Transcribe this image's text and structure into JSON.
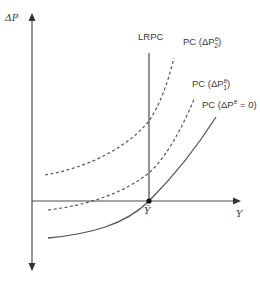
{
  "diagram": {
    "axes": {
      "y_label": "ΔP",
      "x_label": "Y",
      "origin_marker": "Ȳ"
    },
    "lines": {
      "lrpc_label": "LRPC",
      "pc2_label_prefix": "PC (ΔP",
      "pc2_sup": "e",
      "pc2_sub": "2",
      "pc2_label_suffix": ")",
      "pc1_label_prefix": "PC (ΔP",
      "pc1_sup": "e",
      "pc1_sub": "1",
      "pc1_label_suffix": ")",
      "pc0_label_prefix": "PC (ΔP",
      "pc0_sup": "e",
      "pc0_label_suffix": " = 0)"
    },
    "colors": {
      "axis": "#4a4a4a",
      "curve": "#555555",
      "text": "#3a3a3a"
    }
  }
}
